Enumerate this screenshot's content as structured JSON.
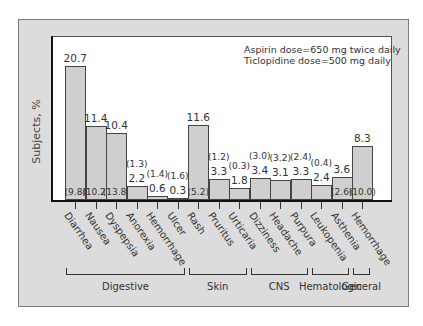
{
  "chart_data": {
    "type": "bar",
    "title": "",
    "ylabel": "Subjects, %",
    "xlabel": "",
    "ylim": [
      0,
      25
    ],
    "grid": false,
    "annotations": [
      "Aspirin dose=650 mg twice daily",
      "Ticlopidine dose=500 mg daily"
    ],
    "categories": [
      "Diarrhea",
      "Nausea",
      "Dyspepsia",
      "Anorexia",
      "Hemorrhage",
      "Ulcer",
      "Rash",
      "Pruritus",
      "Urticaria",
      "Dizziness",
      "Headache",
      "Purpura",
      "Leukopenia",
      "Asthenia",
      "Hemorrhage"
    ],
    "series": [
      {
        "name": "Ticlopidine",
        "values": [
          20.7,
          11.4,
          10.4,
          2.2,
          0.6,
          0.3,
          11.6,
          3.3,
          1.8,
          3.4,
          3.1,
          3.3,
          2.4,
          3.6,
          8.3
        ]
      },
      {
        "name": "Aspirin",
        "values": [
          9.8,
          10.2,
          13.8,
          1.3,
          1.4,
          1.6,
          5.2,
          1.2,
          0.3,
          3.0,
          3.2,
          2.4,
          0.4,
          2.6,
          10.0
        ]
      }
    ],
    "groups": [
      {
        "name": "Digestive",
        "categories": [
          "Diarrhea",
          "Nausea",
          "Dyspepsia",
          "Anorexia",
          "Hemorrhage",
          "Ulcer"
        ]
      },
      {
        "name": "Skin",
        "categories": [
          "Rash",
          "Pruritus",
          "Urticaria"
        ]
      },
      {
        "name": "CNS",
        "categories": [
          "Dizziness",
          "Headache",
          "Purpura"
        ]
      },
      {
        "name": "Hematologic",
        "categories": [
          "Leukopenia",
          "Asthenia"
        ]
      },
      {
        "name": "General",
        "categories": [
          "Hemorrhage"
        ]
      }
    ]
  },
  "labels": {
    "ylabel": "Subjects, %",
    "note_line1": "Aspirin dose=650 mg twice daily",
    "note_line2": "Ticlopidine dose=500 mg daily"
  },
  "bars": [
    {
      "cat": "Diarrhea",
      "tic": "20.7",
      "asp": "(9.8)"
    },
    {
      "cat": "Nausea",
      "tic": "11.4",
      "asp": "(10.2)"
    },
    {
      "cat": "Dyspepsia",
      "tic": "10.4",
      "asp": "(13.8)"
    },
    {
      "cat": "Anorexia",
      "tic": "2.2",
      "asp": "(1.3)"
    },
    {
      "cat": "Hemorrhage",
      "tic": "0.6",
      "asp": "(1.4)"
    },
    {
      "cat": "Ulcer",
      "tic": "0.3",
      "asp": "(1.6)"
    },
    {
      "cat": "Rash",
      "tic": "11.6",
      "asp": "(5.2)"
    },
    {
      "cat": "Pruritus",
      "tic": "3.3",
      "asp": "(1.2)"
    },
    {
      "cat": "Urticaria",
      "tic": "1.8",
      "asp": "(0.3)"
    },
    {
      "cat": "Dizziness",
      "tic": "3.4",
      "asp": "(3.0)"
    },
    {
      "cat": "Headache",
      "tic": "3.1",
      "asp": "(3.2)"
    },
    {
      "cat": "Purpura",
      "tic": "3.3",
      "asp": "(2.4)"
    },
    {
      "cat": "Leukopenia",
      "tic": "2.4",
      "asp": "(0.4)"
    },
    {
      "cat": "Asthenia",
      "tic": "3.6",
      "asp": "(2.6)"
    },
    {
      "cat": "Hemorrhage",
      "tic": "8.3",
      "asp": "(10.0)"
    }
  ],
  "groups": [
    "Digestive",
    "Skin",
    "CNS",
    "Hematologic",
    "General"
  ]
}
